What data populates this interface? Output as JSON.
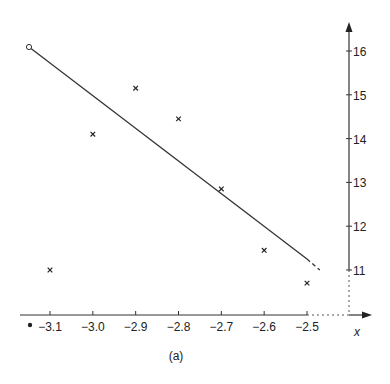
{
  "chart_data": {
    "type": "scatter",
    "title": "",
    "caption": "(a)",
    "xlabel": "x",
    "ylabel": "",
    "x_ticks": [
      -3.1,
      -3.0,
      -2.9,
      -2.8,
      -2.7,
      -2.6,
      -2.5
    ],
    "x_tick_labels": [
      "−3.1",
      "−3.0",
      "−2.9",
      "−2.8",
      "−2.7",
      "−2.6",
      "−2.5"
    ],
    "y_ticks": [
      11,
      12,
      13,
      14,
      15,
      16
    ],
    "y_tick_labels": [
      "11",
      "12",
      "13",
      "14",
      "15",
      "16"
    ],
    "xlim": [
      -3.17,
      -2.35
    ],
    "ylim": [
      9.9,
      16.8
    ],
    "grid": false,
    "legend": null,
    "series": [
      {
        "name": "data points",
        "marker": "x",
        "points": [
          {
            "x": -3.1,
            "y": 11.0
          },
          {
            "x": -3.0,
            "y": 14.1
          },
          {
            "x": -2.9,
            "y": 15.15
          },
          {
            "x": -2.8,
            "y": 14.45
          },
          {
            "x": -2.7,
            "y": 12.85
          },
          {
            "x": -2.6,
            "y": 11.45
          },
          {
            "x": -2.5,
            "y": 10.7
          }
        ]
      },
      {
        "name": "fitted line",
        "type": "line",
        "points": [
          {
            "x": -3.15,
            "y": 16.1
          },
          {
            "x": -2.5,
            "y": 11.25
          }
        ],
        "dashed_extension": [
          {
            "x": -2.5,
            "y": 11.25
          },
          {
            "x": -2.47,
            "y": 11.0
          }
        ],
        "start_marker": "open-circle"
      }
    ],
    "annotations": [
      {
        "type": "dot",
        "x": -3.15,
        "y": 9.9,
        "note": "filled dot left of -3.1 label"
      },
      {
        "type": "dotted-guide",
        "from": {
          "x": -2.5,
          "y": 9.9
        },
        "to": {
          "x": -2.35,
          "y": 9.9
        }
      },
      {
        "type": "dotted-guide",
        "from": {
          "x": -2.35,
          "y": 9.9
        },
        "to": {
          "x": -2.35,
          "y": 11
        }
      }
    ]
  }
}
